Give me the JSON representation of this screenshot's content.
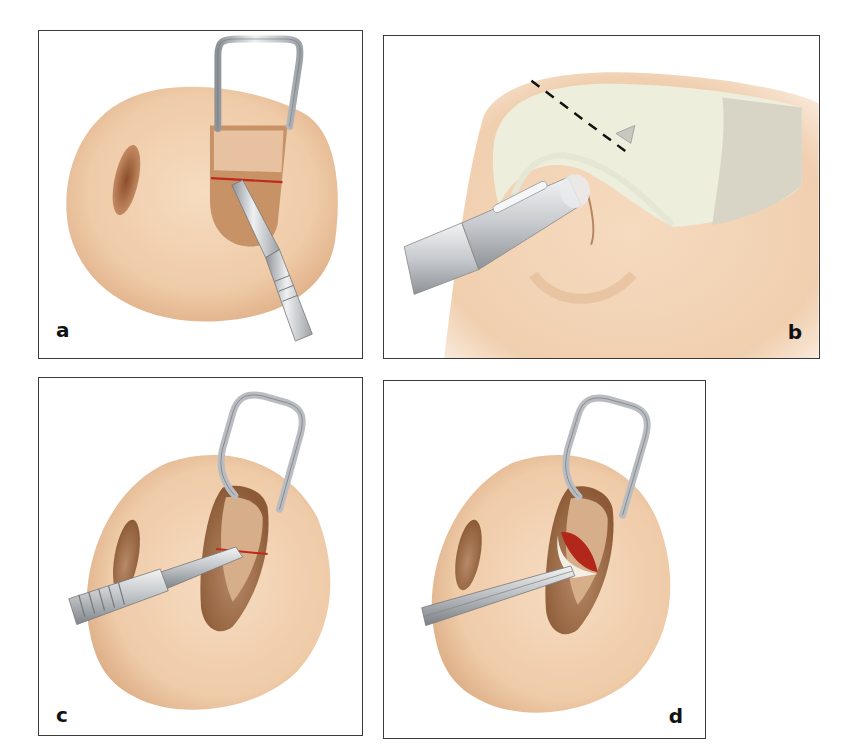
{
  "figure": {
    "panels": [
      {
        "id": "a",
        "label": "a",
        "content": "Nose tip with retractor in nostril, scalpel making intercartilaginous incision (red line)"
      },
      {
        "id": "b",
        "label": "b",
        "content": "Lateral view with cartilage exposed, dashed line marking cut, instrument inserted through nostril"
      },
      {
        "id": "c",
        "label": "c",
        "content": "Retractor holding nostril, scalpel making horizontal incision from the side"
      },
      {
        "id": "d",
        "label": "d",
        "content": "Forceps grasping and lifting flap revealing red tissue"
      }
    ],
    "colors": {
      "skin": "#f2d2b3",
      "skin_shadow": "#d9a97f",
      "nostril": "#a8683f",
      "incision": "#c0281c",
      "metal": "#c9ccd0",
      "metal_dark": "#7d8288",
      "cartilage": "#eeeede",
      "border": "#3a3a3a"
    }
  }
}
